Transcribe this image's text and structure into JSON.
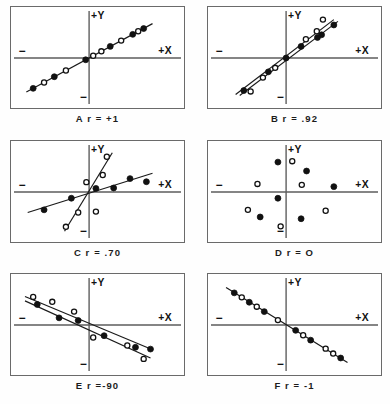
{
  "figure": {
    "background": "#ffffff",
    "border_color": "#6a6a6a",
    "axis_color": "#5d5d5d",
    "line_color": "#1a1a1a",
    "point_filled_color": "#111111",
    "point_open_color": "#ffffff"
  },
  "axis_labels": {
    "x_positive": "+X",
    "y_positive": "+Y",
    "x_negative": "−",
    "y_negative": "−"
  },
  "panels": [
    {
      "id": "A",
      "caption": "A  r = +1",
      "letter": "A",
      "r_text": "r = +1",
      "r_value": 1.0
    },
    {
      "id": "B",
      "caption": "B  r = .92",
      "letter": "B",
      "r_text": "r = .92",
      "r_value": 0.92
    },
    {
      "id": "C",
      "caption": "C  r = .70",
      "letter": "C",
      "r_text": "r = .70",
      "r_value": 0.7
    },
    {
      "id": "D",
      "caption": "D  r = O",
      "letter": "D",
      "r_text": "r = O",
      "r_value": 0.0
    },
    {
      "id": "E",
      "caption": "E  r =-90",
      "letter": "E",
      "r_text": "r =-90",
      "r_value": -0.9
    },
    {
      "id": "F",
      "caption": "F  r = -1",
      "letter": "F",
      "r_text": "r = -1",
      "r_value": -1.0
    }
  ],
  "chart_data": [
    {
      "type": "scatter",
      "id": "A",
      "title": "A  r = +1",
      "xlabel": "+X",
      "ylabel": "+Y",
      "xlim": [
        -10,
        10
      ],
      "ylim": [
        -10,
        10
      ],
      "grid": false,
      "legend": "none",
      "annotations": [
        "+Y",
        "+X",
        "−",
        "−"
      ],
      "fit_lines": [
        {
          "name": "regression",
          "x1": -9.2,
          "y1": -7.6,
          "x2": 9.3,
          "y2": 7.7
        }
      ],
      "series": [
        {
          "name": "filled",
          "marker": "filled-circle",
          "points": [
            [
              -8.2,
              -6.8
            ],
            [
              -5.1,
              -4.2
            ],
            [
              -0.5,
              -0.4
            ],
            [
              3.1,
              2.6
            ],
            [
              6.4,
              5.3
            ],
            [
              8.0,
              6.6
            ]
          ]
        },
        {
          "name": "open",
          "marker": "open-circle",
          "points": [
            [
              -6.6,
              -5.5
            ],
            [
              -3.4,
              -2.8
            ],
            [
              0.6,
              0.5
            ],
            [
              1.8,
              1.5
            ],
            [
              4.7,
              3.9
            ],
            [
              7.2,
              6.0
            ]
          ]
        }
      ]
    },
    {
      "type": "scatter",
      "id": "B",
      "title": "B  r = .92",
      "xlabel": "+X",
      "ylabel": "+Y",
      "xlim": [
        -10,
        10
      ],
      "ylim": [
        -10,
        10
      ],
      "grid": false,
      "legend": "none",
      "annotations": [
        "+Y",
        "+X",
        "−",
        "−"
      ],
      "fit_lines": [
        {
          "name": "regression-1",
          "x1": -6.8,
          "y1": -8.4,
          "x2": 7.6,
          "y2": 8.2
        },
        {
          "name": "regression-2",
          "x1": -7.4,
          "y1": -8.2,
          "x2": 7.0,
          "y2": 8.6
        }
      ],
      "series": [
        {
          "name": "filled",
          "marker": "filled-circle",
          "points": [
            [
              -6.2,
              -7.3
            ],
            [
              -2.6,
              -3.1
            ],
            [
              0.0,
              0.0
            ],
            [
              2.2,
              2.6
            ],
            [
              4.6,
              4.6
            ],
            [
              5.2,
              5.2
            ],
            [
              7.0,
              7.4
            ]
          ]
        },
        {
          "name": "open",
          "marker": "open-circle",
          "points": [
            [
              -5.2,
              -7.5
            ],
            [
              -3.4,
              -4.4
            ],
            [
              -1.6,
              -2.2
            ],
            [
              2.9,
              4.2
            ],
            [
              4.5,
              6.0
            ],
            [
              5.4,
              8.6
            ]
          ]
        }
      ]
    },
    {
      "type": "scatter",
      "id": "C",
      "title": "C  r = .70",
      "xlabel": "+X",
      "ylabel": "+Y",
      "xlim": [
        -10,
        10
      ],
      "ylim": [
        -10,
        10
      ],
      "grid": false,
      "legend": "none",
      "annotations": [
        "+Y",
        "+X",
        "−",
        "−"
      ],
      "fit_lines": [
        {
          "name": "shallow-line",
          "x1": -9.0,
          "y1": -4.6,
          "x2": 9.3,
          "y2": 4.2
        },
        {
          "name": "steep-line",
          "x1": -3.6,
          "y1": -8.8,
          "x2": 3.4,
          "y2": 8.8
        }
      ],
      "series": [
        {
          "name": "filled",
          "marker": "filled-circle",
          "points": [
            [
              -6.6,
              -4.0
            ],
            [
              -2.6,
              -1.4
            ],
            [
              1.0,
              0.8
            ],
            [
              3.6,
              0.9
            ],
            [
              6.0,
              3.0
            ],
            [
              8.4,
              2.3
            ]
          ]
        },
        {
          "name": "open",
          "marker": "open-circle",
          "points": [
            [
              -3.4,
              -7.8
            ],
            [
              -1.6,
              -4.6
            ],
            [
              -0.4,
              2.2
            ],
            [
              1.0,
              -4.4
            ],
            [
              2.0,
              3.8
            ],
            [
              2.6,
              7.9
            ]
          ]
        }
      ]
    },
    {
      "type": "scatter",
      "id": "D",
      "title": "D  r = O",
      "xlabel": "+X",
      "ylabel": "+Y",
      "xlim": [
        -10,
        10
      ],
      "ylim": [
        -10,
        10
      ],
      "grid": false,
      "legend": "none",
      "annotations": [
        "+Y",
        "+X",
        "−",
        "−"
      ],
      "fit_lines": [],
      "series": [
        {
          "name": "filled",
          "marker": "filled-circle",
          "points": [
            [
              -1.2,
              6.7
            ],
            [
              3.0,
              4.7
            ],
            [
              7.0,
              1.2
            ],
            [
              -1.2,
              -1.4
            ],
            [
              -3.8,
              -5.6
            ],
            [
              2.2,
              -6.0
            ]
          ]
        },
        {
          "name": "open",
          "marker": "open-circle",
          "points": [
            [
              0.9,
              6.9
            ],
            [
              -4.2,
              1.8
            ],
            [
              2.3,
              1.6
            ],
            [
              -5.6,
              -4.0
            ],
            [
              5.8,
              -4.2
            ],
            [
              -0.8,
              -7.7
            ]
          ]
        }
      ]
    },
    {
      "type": "scatter",
      "id": "E",
      "title": "E  r =-90",
      "xlabel": "+X",
      "ylabel": "+Y",
      "xlim": [
        -10,
        10
      ],
      "ylim": [
        -10,
        10
      ],
      "grid": false,
      "legend": "none",
      "annotations": [
        "+Y",
        "+X",
        "−",
        "−"
      ],
      "fit_lines": [
        {
          "name": "regression-1",
          "x1": -9.4,
          "y1": 6.4,
          "x2": 9.4,
          "y2": -5.6
        },
        {
          "name": "regression-2",
          "x1": -9.4,
          "y1": 5.4,
          "x2": 9.0,
          "y2": -7.4
        }
      ],
      "series": [
        {
          "name": "filled",
          "marker": "filled-circle",
          "points": [
            [
              -7.6,
              4.6
            ],
            [
              -4.4,
              1.6
            ],
            [
              -1.6,
              1.0
            ],
            [
              2.2,
              -2.4
            ],
            [
              6.8,
              -5.0
            ],
            [
              9.0,
              -5.4
            ]
          ]
        },
        {
          "name": "open",
          "marker": "open-circle",
          "points": [
            [
              -8.2,
              6.3
            ],
            [
              -5.4,
              5.2
            ],
            [
              -2.2,
              3.0
            ],
            [
              0.6,
              -2.8
            ],
            [
              5.6,
              -4.6
            ],
            [
              8.0,
              -7.6
            ]
          ]
        }
      ]
    },
    {
      "type": "scatter",
      "id": "F",
      "title": "F  r = -1",
      "xlabel": "+X",
      "ylabel": "+Y",
      "xlim": [
        -10,
        10
      ],
      "ylim": [
        -10,
        10
      ],
      "grid": false,
      "legend": "none",
      "annotations": [
        "+Y",
        "+X",
        "−",
        "−"
      ],
      "fit_lines": [
        {
          "name": "regression",
          "x1": -8.8,
          "y1": 8.4,
          "x2": 9.0,
          "y2": -8.4
        }
      ],
      "series": [
        {
          "name": "filled",
          "marker": "filled-circle",
          "points": [
            [
              -7.6,
              7.2
            ],
            [
              -5.4,
              5.1
            ],
            [
              -3.2,
              3.0
            ],
            [
              1.4,
              -1.2
            ],
            [
              3.6,
              -3.4
            ],
            [
              8.0,
              -7.4
            ]
          ]
        },
        {
          "name": "open",
          "marker": "open-circle",
          "points": [
            [
              -6.5,
              6.2
            ],
            [
              -4.3,
              4.1
            ],
            [
              -1.2,
              1.1
            ],
            [
              2.5,
              -2.3
            ],
            [
              5.8,
              -5.3
            ],
            [
              6.9,
              -6.4
            ]
          ]
        }
      ]
    }
  ]
}
